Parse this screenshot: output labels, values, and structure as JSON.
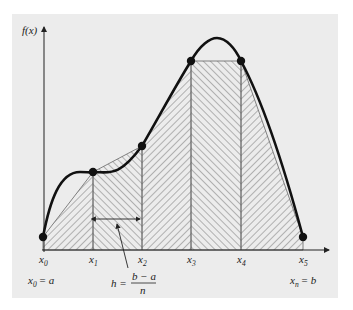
{
  "diagram": {
    "type": "trapezoidal-rule-illustration",
    "y_axis_label": "f(x)",
    "x_labels": [
      "x",
      "x",
      "x",
      "x",
      "x",
      "x"
    ],
    "x_subscripts": [
      "0",
      "1",
      "2",
      "3",
      "4",
      "5"
    ],
    "left_endpoint_label": {
      "var": "x",
      "sub": "0",
      "rhs": "= a"
    },
    "right_endpoint_label": {
      "var": "x",
      "sub": "n",
      "rhs": "= b"
    },
    "step_label": {
      "lhs": "h =",
      "numerator": "b − a",
      "denominator": "n"
    },
    "points": [
      {
        "name": "x0",
        "px": 43,
        "py": 237
      },
      {
        "name": "x1",
        "px": 93,
        "py": 172
      },
      {
        "name": "x2",
        "px": 142,
        "py": 146
      },
      {
        "name": "x3",
        "px": 191,
        "py": 61
      },
      {
        "name": "x4",
        "px": 241,
        "py": 61
      },
      {
        "name": "x5",
        "px": 303,
        "py": 237
      }
    ],
    "colors": {
      "background": "#ececec",
      "curve": "#111111",
      "hatch": "#555555"
    }
  }
}
